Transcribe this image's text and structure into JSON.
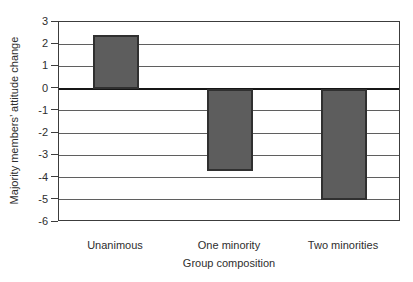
{
  "figure": {
    "background": "#ffffff",
    "text_color": "#2e2e2e"
  },
  "chart_data": {
    "type": "bar",
    "title": "",
    "categories": [
      "Unanimous",
      "One minority",
      "Two minorities"
    ],
    "values": [
      2.4,
      -3.7,
      -5.0
    ],
    "xlabel": "Group composition",
    "ylabel": "Majority members’ attitude change",
    "ylim": [
      -6,
      3
    ],
    "yticks": [
      3,
      2,
      1,
      0,
      -1,
      -2,
      -3,
      -4,
      -5,
      -6
    ],
    "grid": true,
    "legend": false,
    "bar_color": "#5d5d5d",
    "bar_border_color": "#303030",
    "grid_color": "#5f5f5f",
    "zero_line_color": "#161616",
    "axis_color": "#3c3c3c"
  }
}
